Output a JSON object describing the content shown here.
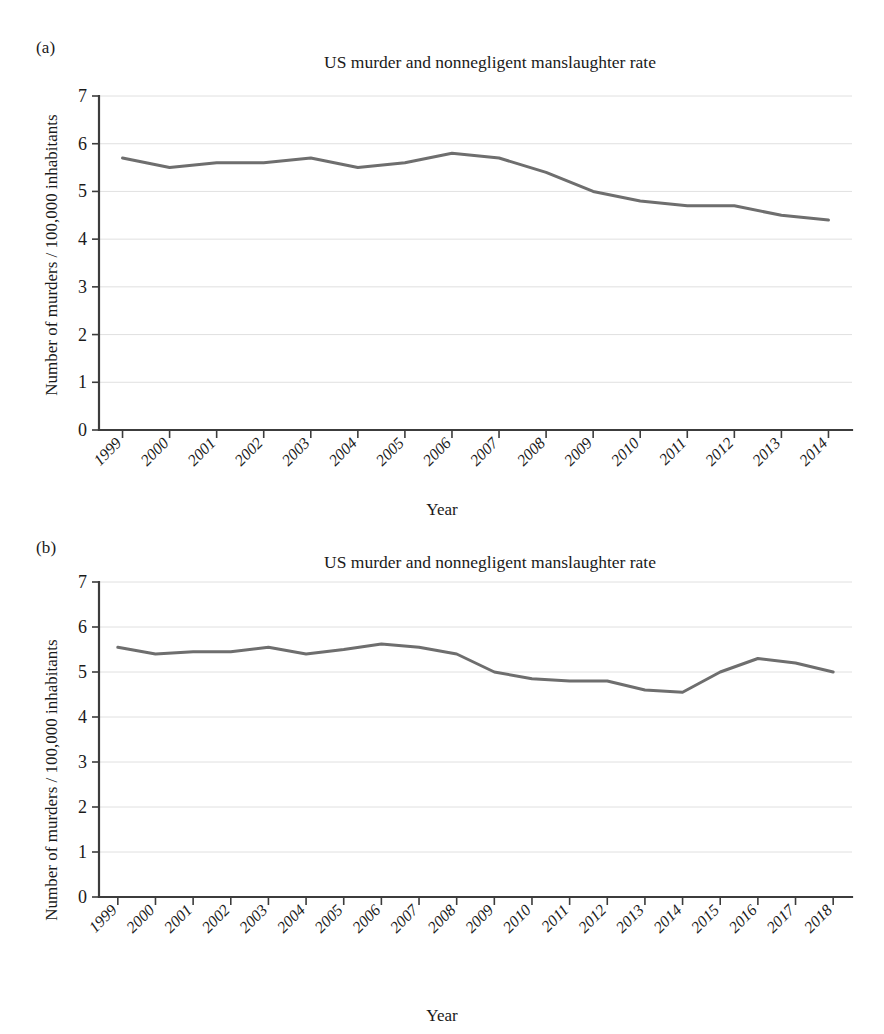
{
  "figure": {
    "panels": [
      {
        "tag": "(a)",
        "title": "US murder and nonnegligent manslaughter rate",
        "xlabel": "Year",
        "ylabel": "Number of murders / 100,000 inhabitants"
      },
      {
        "tag": "(b)",
        "title": "US murder and nonnegligent manslaughter rate",
        "xlabel": "Year",
        "ylabel": "Number of murders / 100,000 inhabitants"
      }
    ],
    "line_color": "#6e6e6e",
    "grid_color": "#d8d8d8",
    "axis_color": "#3c3c3c"
  },
  "chart_data": [
    {
      "type": "line",
      "panel": "(a)",
      "title": "US murder and nonnegligent manslaughter rate",
      "xlabel": "Year",
      "ylabel": "Number of murders / 100,000 inhabitants",
      "categories": [
        "1999",
        "2000",
        "2001",
        "2002",
        "2003",
        "2004",
        "2005",
        "2006",
        "2007",
        "2008",
        "2009",
        "2010",
        "2011",
        "2012",
        "2013",
        "2014"
      ],
      "values": [
        5.7,
        5.5,
        5.6,
        5.6,
        5.7,
        5.5,
        5.6,
        5.8,
        5.7,
        5.4,
        5.0,
        4.8,
        4.7,
        4.7,
        4.5,
        4.4
      ],
      "ylim": [
        0,
        7
      ],
      "yticks": [
        0,
        1,
        2,
        3,
        4,
        5,
        6,
        7
      ],
      "grid": true,
      "legend": "none"
    },
    {
      "type": "line",
      "panel": "(b)",
      "title": "US murder and nonnegligent manslaughter rate",
      "xlabel": "Year",
      "ylabel": "Number of murders / 100,000 inhabitants",
      "categories": [
        "1999",
        "2000",
        "2001",
        "2002",
        "2003",
        "2004",
        "2005",
        "2006",
        "2007",
        "2008",
        "2009",
        "2010",
        "2011",
        "2012",
        "2013",
        "2014",
        "2015",
        "2016",
        "2017",
        "2018"
      ],
      "values": [
        5.55,
        5.4,
        5.45,
        5.45,
        5.55,
        5.4,
        5.5,
        5.62,
        5.55,
        5.4,
        5.0,
        4.85,
        4.8,
        4.8,
        4.6,
        4.55,
        5.0,
        5.3,
        5.2,
        5.0
      ],
      "ylim": [
        0,
        7
      ],
      "yticks": [
        0,
        1,
        2,
        3,
        4,
        5,
        6,
        7
      ],
      "grid": true,
      "legend": "none"
    }
  ]
}
